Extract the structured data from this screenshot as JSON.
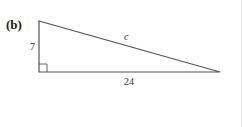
{
  "figure": {
    "part_label": "(b)",
    "shape": "right-triangle",
    "sides": {
      "vertical_leg": "7",
      "horizontal_leg": "24",
      "hypotenuse": "c"
    },
    "right_angle_marker": "bottom-left"
  }
}
